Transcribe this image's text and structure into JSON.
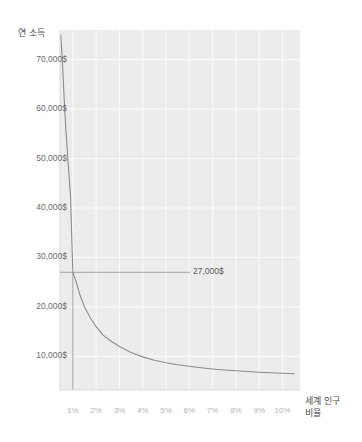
{
  "chart_data": {
    "type": "line",
    "title": "",
    "subtitle": "",
    "xlabel": "세계 인구\n비율",
    "ylabel": "연 소득",
    "grid": true,
    "legend": false,
    "legend_position": "none",
    "xlim": [
      0.45,
      10.75
    ],
    "ylim": [
      3200,
      76000
    ],
    "x_tick_labels": [
      "1%",
      "2%",
      "3%",
      "4%",
      "5%",
      "6%",
      "7%",
      "8%",
      "9%",
      "10%"
    ],
    "x_tick_values": [
      1,
      2,
      3,
      4,
      5,
      6,
      7,
      8,
      9,
      10
    ],
    "y_tick_labels": [
      "10,000$",
      "20,000$",
      "30,000$",
      "40,000$",
      "50,000$",
      "60,000$",
      "70,000$"
    ],
    "y_tick_values": [
      10000,
      20000,
      30000,
      40000,
      50000,
      60000,
      70000
    ],
    "series": [
      {
        "name": "연 소득 분포 곡선",
        "curve_type": "hyperbolic",
        "x": [
          0.48,
          0.55,
          0.62,
          0.7,
          0.8,
          0.9,
          1.0,
          1.15,
          1.3,
          1.5,
          1.75,
          2.0,
          2.3,
          2.6,
          3.0,
          3.5,
          4.0,
          4.5,
          5.0,
          5.5,
          6.0,
          6.5,
          7.0,
          7.5,
          8.0,
          8.5,
          9.0,
          9.5,
          10.0,
          10.5
        ],
        "values": [
          75000,
          70000,
          63000,
          56000,
          49000,
          42500,
          27000,
          25000,
          22500,
          20000,
          17800,
          16000,
          14300,
          13200,
          12000,
          10800,
          9900,
          9200,
          8700,
          8300,
          8000,
          7700,
          7450,
          7250,
          7080,
          6930,
          6800,
          6690,
          6590,
          6500
        ]
      }
    ],
    "annotations": [
      {
        "name": "intersection-value",
        "label": "27,000$",
        "x": 1,
        "y": 27000,
        "marker_lines": [
          "horizontal-from-axis",
          "vertical-from-axis"
        ]
      }
    ],
    "colors": {
      "plot_background": "#ececec",
      "gridline": "#fafafa",
      "curve": "#8c8c8c",
      "marker_line": "#9a9a9a",
      "axis_title": "#4d4d4d",
      "y_tick_text": "#6b6b6b",
      "x_tick_text": "#b4b4b4",
      "annotation_text": "#5a5a5a",
      "page_background": "#ffffff"
    }
  }
}
